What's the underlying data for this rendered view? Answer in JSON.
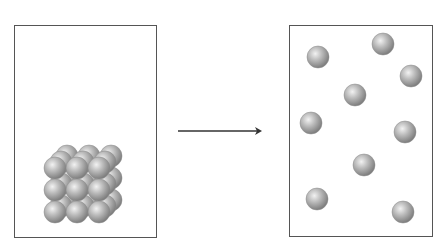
{
  "diagram": {
    "colors": {
      "border": "#555555",
      "particle_light": "#e6e6e6",
      "particle_mid": "#b4b4b4",
      "particle_dark": "#7a7a7a",
      "arrow": "#333333"
    },
    "left_box": {
      "x": 14,
      "y": 25,
      "w": 143,
      "h": 213,
      "state": "solid"
    },
    "right_box": {
      "x": 289,
      "y": 25,
      "w": 144,
      "h": 212,
      "state": "gas"
    },
    "arrow": {
      "x1": 178,
      "y1": 131,
      "x2": 262,
      "y2": 131
    },
    "solid_lattice": {
      "front_origin": {
        "x": 55,
        "y": 168
      },
      "spacing": 22,
      "rows": 3,
      "cols": 3,
      "layers": 3,
      "layer_offset": {
        "dx": 6,
        "dy": -6
      },
      "radius": 11
    },
    "gas_particles": [
      {
        "x": 318,
        "y": 57
      },
      {
        "x": 383,
        "y": 44
      },
      {
        "x": 411,
        "y": 76
      },
      {
        "x": 355,
        "y": 95
      },
      {
        "x": 311,
        "y": 123
      },
      {
        "x": 405,
        "y": 132
      },
      {
        "x": 364,
        "y": 165
      },
      {
        "x": 317,
        "y": 199
      },
      {
        "x": 403,
        "y": 212
      }
    ],
    "gas_radius": 11
  }
}
